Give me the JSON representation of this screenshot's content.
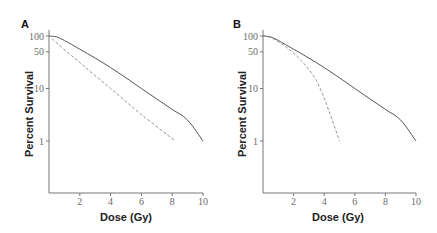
{
  "chart_data": [
    {
      "panel": "A",
      "type": "line",
      "title": "",
      "xlabel": "Dose (Gy)",
      "ylabel": "Percent Survival",
      "yscale": "log",
      "xlim": [
        0,
        10
      ],
      "ylim": [
        0.1,
        100
      ],
      "xticks": [
        2,
        4,
        6,
        8,
        10
      ],
      "yticks": [
        100,
        50,
        10,
        1
      ],
      "grid": false,
      "legend": null,
      "series": [
        {
          "name": "solid",
          "style": "solid",
          "x": [
            0,
            0.5,
            1,
            2,
            3,
            4,
            5,
            6,
            7,
            8,
            9,
            10
          ],
          "y": [
            100,
            96,
            82,
            56,
            38,
            25,
            16,
            10,
            6.3,
            4,
            2.5,
            1
          ]
        },
        {
          "name": "dashed",
          "style": "dashed",
          "x": [
            0.2,
            2,
            4,
            6,
            8.2
          ],
          "y": [
            88,
            31,
            10,
            3.2,
            1
          ]
        }
      ]
    },
    {
      "panel": "B",
      "type": "line",
      "title": "",
      "xlabel": "Dose (Gy)",
      "ylabel": "Percent Survival",
      "yscale": "log",
      "xlim": [
        0,
        10
      ],
      "ylim": [
        0.1,
        100
      ],
      "xticks": [
        2,
        4,
        6,
        8,
        10
      ],
      "yticks": [
        100,
        50,
        10,
        1
      ],
      "grid": false,
      "legend": null,
      "series": [
        {
          "name": "solid",
          "style": "solid",
          "x": [
            0,
            0.5,
            1,
            2,
            3,
            4,
            5,
            6,
            7,
            8,
            9,
            10
          ],
          "y": [
            100,
            96,
            82,
            56,
            38,
            25,
            16,
            10,
            6.3,
            4,
            2.5,
            1
          ]
        },
        {
          "name": "dashed",
          "style": "dashed",
          "x": [
            0,
            0.5,
            1,
            1.5,
            2,
            2.5,
            3,
            3.5,
            4,
            4.5,
            5
          ],
          "y": [
            100,
            94,
            78,
            62,
            47,
            34,
            23,
            14,
            6.5,
            2.6,
            1
          ]
        }
      ]
    }
  ],
  "panels": [
    {
      "label": "A",
      "xlabel": "Dose (Gy)",
      "ylabel": "Percent Survival"
    },
    {
      "label": "B",
      "xlabel": "Dose (Gy)",
      "ylabel": "Percent Survival"
    }
  ],
  "colors": {
    "solid_line": "#555555",
    "dashed_line": "#888888",
    "axis": "#777777"
  }
}
